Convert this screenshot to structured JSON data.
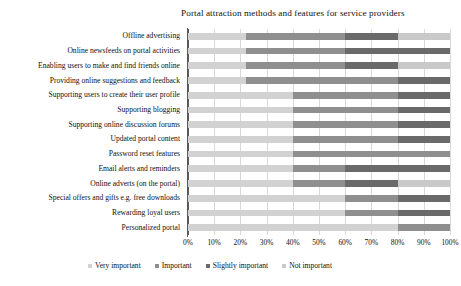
{
  "chart_data": {
    "type": "bar",
    "subtype": "stacked-horizontal-100-percent",
    "title": "Portal attraction methods and features for service providers",
    "xlabel": "",
    "ylabel": "",
    "xlim": [
      0,
      100
    ],
    "grid": true,
    "legend_position": "bottom",
    "xticks": [
      "0%",
      "10%",
      "20%",
      "30%",
      "40%",
      "50%",
      "60%",
      "70%",
      "80%",
      "90%",
      "100%"
    ],
    "xtick_values": [
      0,
      10,
      20,
      30,
      40,
      50,
      60,
      70,
      80,
      90,
      100
    ],
    "categories": [
      "Offline advertising",
      "Online newsfeeds on portal activities",
      "Enabling users to make and find friends online",
      "Providing online suggestions and feedback",
      "Supporting users to create their user profile",
      "Supporting blogging",
      "Supporting online discussion forums",
      "Updated portal content",
      "Password reset features",
      "Email alerts and reminders",
      "Online adverts (on the portal)",
      "Special offers and gifts e.g. free downloads",
      "Rewarding loyal users",
      "Personalized portal"
    ],
    "series": [
      {
        "name": "Very important",
        "color": "#d2d2d2",
        "values": [
          22,
          22,
          22,
          22,
          40,
          40,
          40,
          40,
          40,
          40,
          40,
          60,
          60,
          80
        ]
      },
      {
        "name": "Important",
        "color": "#8f8f8f",
        "values": [
          38,
          38,
          38,
          58,
          40,
          40,
          40,
          40,
          60,
          20,
          20,
          20,
          20,
          20
        ]
      },
      {
        "name": "Slightly important",
        "color": "#6a6a6a",
        "values": [
          20,
          40,
          20,
          20,
          20,
          20,
          20,
          20,
          0,
          40,
          20,
          20,
          20,
          0
        ]
      },
      {
        "name": "Not important",
        "color": "#c9c9c9",
        "values": [
          20,
          0,
          20,
          0,
          0,
          0,
          0,
          0,
          0,
          0,
          20,
          0,
          0,
          0
        ]
      }
    ]
  }
}
